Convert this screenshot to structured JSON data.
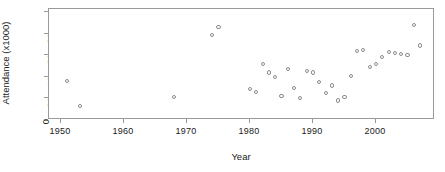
{
  "chart_data": {
    "type": "scatter",
    "title": "",
    "xlabel": "Year",
    "ylabel": "Attendance (x1000)",
    "xlim": [
      1947,
      2008
    ],
    "ylim": [
      0,
      103
    ],
    "xticks": [
      1950,
      1960,
      1970,
      1980,
      1990,
      2000
    ],
    "xtick_labels": [
      "1950",
      "1960",
      "1970",
      "1980",
      "1990",
      "2000"
    ],
    "yticks": [
      0,
      20,
      40,
      60,
      80,
      100
    ],
    "ytick_labels": [
      "0",
      "20",
      "40",
      "60",
      "80",
      "100"
    ],
    "grid": false,
    "legend": null,
    "marker": "open-circle",
    "marker_color": "#8c8c8c",
    "frame_color": "#9a9a9a",
    "x": [
      1951,
      1953,
      1968,
      1974,
      1975,
      1980,
      1980.5,
      1981,
      1982,
      1983,
      1984,
      1985,
      1986,
      1987,
      1988,
      1989,
      1990,
      1991,
      1992,
      1993,
      1994,
      1995,
      1996,
      1997,
      1998,
      1999,
      2000,
      2001,
      2002,
      2003,
      2004,
      2005,
      2006
    ],
    "y": [
      36,
      13,
      21,
      79,
      86,
      29,
      26,
      52,
      44,
      40,
      22,
      47,
      30,
      20,
      45,
      44,
      35,
      25,
      32,
      18,
      21,
      41,
      64,
      65,
      49,
      52,
      58,
      63,
      62,
      61,
      60,
      88,
      69
    ],
    "points": [
      {
        "year": 1951,
        "attendance": 36
      },
      {
        "year": 1953,
        "attendance": 13
      },
      {
        "year": 1968,
        "attendance": 21
      },
      {
        "year": 1974,
        "attendance": 79
      },
      {
        "year": 1975,
        "attendance": 86
      },
      {
        "year": 1980,
        "attendance": 29
      },
      {
        "year": 1981,
        "attendance": 26
      },
      {
        "year": 1982,
        "attendance": 52
      },
      {
        "year": 1983,
        "attendance": 44
      },
      {
        "year": 1984,
        "attendance": 40
      },
      {
        "year": 1985,
        "attendance": 22
      },
      {
        "year": 1986,
        "attendance": 47
      },
      {
        "year": 1987,
        "attendance": 30
      },
      {
        "year": 1988,
        "attendance": 20
      },
      {
        "year": 1989,
        "attendance": 45
      },
      {
        "year": 1990,
        "attendance": 44
      },
      {
        "year": 1991,
        "attendance": 35
      },
      {
        "year": 1992,
        "attendance": 25
      },
      {
        "year": 1993,
        "attendance": 32
      },
      {
        "year": 1994,
        "attendance": 18
      },
      {
        "year": 1995,
        "attendance": 21
      },
      {
        "year": 1996,
        "attendance": 41
      },
      {
        "year": 1997,
        "attendance": 64
      },
      {
        "year": 1998,
        "attendance": 65
      },
      {
        "year": 1999,
        "attendance": 49
      },
      {
        "year": 2000,
        "attendance": 52
      },
      {
        "year": 2001,
        "attendance": 58
      },
      {
        "year": 2002,
        "attendance": 63
      },
      {
        "year": 2003,
        "attendance": 62
      },
      {
        "year": 2004,
        "attendance": 61
      },
      {
        "year": 2005,
        "attendance": 60
      },
      {
        "year": 2006,
        "attendance": 88
      },
      {
        "year": 2007,
        "attendance": 69
      }
    ]
  }
}
